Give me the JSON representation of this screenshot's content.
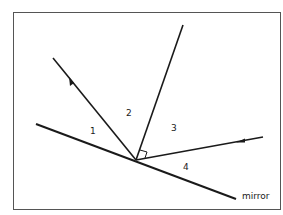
{
  "diagram": {
    "labels": {
      "angle1": "1",
      "angle2": "2",
      "angle3": "3",
      "angle4": "4",
      "mirror": "mirror"
    },
    "elements": [
      {
        "id": "mirror",
        "type": "line",
        "from": [
          36,
          124
        ],
        "to": [
          236,
          199
        ]
      },
      {
        "id": "normal",
        "type": "line",
        "from": [
          136,
          160
        ],
        "to": [
          183,
          25
        ]
      },
      {
        "id": "incident-ray",
        "type": "arrow-line",
        "from": [
          263,
          137
        ],
        "to": [
          136,
          160
        ],
        "arrow_at": [
          238,
          142
        ]
      },
      {
        "id": "reflected-ray",
        "type": "arrow-line",
        "from": [
          136,
          160
        ],
        "to": [
          53,
          58
        ],
        "arrow_at": [
          71,
          80
        ]
      },
      {
        "id": "right-angle-marker",
        "type": "square",
        "at": [
          136,
          160
        ]
      }
    ],
    "colors": {
      "line": "#1a1a1a",
      "frame": "#555555",
      "background": "#ffffff"
    }
  }
}
